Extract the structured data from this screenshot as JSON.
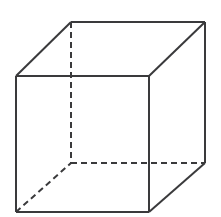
{
  "figure": {
    "kind": "geometric-line-drawing",
    "shape_name": "cube",
    "canvas": {
      "width": 221,
      "height": 217,
      "background_color": "#ffffff"
    },
    "style": {
      "line_color": "#3a3a3c",
      "line_width": 2,
      "hidden_line_color": "#3a3a3c",
      "hidden_line_width": 2,
      "dash_length": 6,
      "dash_gap": 4,
      "face_fill": "none"
    },
    "vertices": {
      "front_top_left": {
        "x": 16,
        "y": 76,
        "label": "A",
        "visible": true
      },
      "front_top_right": {
        "x": 149,
        "y": 76,
        "label": "B",
        "visible": true
      },
      "front_bottom_right": {
        "x": 149,
        "y": 212,
        "label": "C",
        "visible": true
      },
      "front_bottom_left": {
        "x": 16,
        "y": 212,
        "label": "D",
        "visible": true
      },
      "back_top_left": {
        "x": 71,
        "y": 22,
        "label": "E",
        "visible": true
      },
      "back_top_right": {
        "x": 205,
        "y": 22,
        "label": "F",
        "visible": true
      },
      "back_bottom_right": {
        "x": 205,
        "y": 163,
        "label": "G",
        "visible": true
      },
      "back_bottom_left": {
        "x": 71,
        "y": 163,
        "label": "H",
        "visible": false
      }
    },
    "edges": [
      {
        "name": "front-top",
        "from": "front_top_left",
        "to": "front_top_right",
        "style": "solid",
        "points": "16,76 149,76"
      },
      {
        "name": "front-right",
        "from": "front_top_right",
        "to": "front_bottom_right",
        "style": "solid",
        "points": "149,76 149,212"
      },
      {
        "name": "front-bottom",
        "from": "front_bottom_right",
        "to": "front_bottom_left",
        "style": "solid",
        "points": "149,212 16,212"
      },
      {
        "name": "front-left",
        "from": "front_bottom_left",
        "to": "front_top_left",
        "style": "solid",
        "points": "16,212 16,76"
      },
      {
        "name": "back-top",
        "from": "back_top_left",
        "to": "back_top_right",
        "style": "solid",
        "points": "71,22 205,22"
      },
      {
        "name": "back-right",
        "from": "back_top_right",
        "to": "back_bottom_right",
        "style": "solid",
        "points": "205,22 205,163"
      },
      {
        "name": "connect-top-left",
        "from": "front_top_left",
        "to": "back_top_left",
        "style": "solid",
        "points": "16,76 71,22"
      },
      {
        "name": "connect-top-right",
        "from": "front_top_right",
        "to": "back_top_right",
        "style": "solid",
        "points": "149,76 205,22"
      },
      {
        "name": "connect-bottom-right",
        "from": "front_bottom_right",
        "to": "back_bottom_right",
        "style": "solid",
        "points": "149,212 205,163"
      },
      {
        "name": "back-left-vertical-hidden",
        "from": "back_top_left",
        "to": "back_bottom_left",
        "style": "dashed",
        "points": "71,22 71,163"
      },
      {
        "name": "back-bottom-hidden",
        "from": "back_bottom_left",
        "to": "back_bottom_right",
        "style": "dashed",
        "points": "71,163 205,163"
      },
      {
        "name": "connect-bottom-left-hidden",
        "from": "front_bottom_left",
        "to": "back_bottom_left",
        "style": "dashed",
        "points": "16,212 71,163"
      }
    ]
  }
}
